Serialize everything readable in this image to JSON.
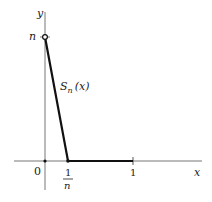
{
  "diagram": {
    "type": "function-graph",
    "axes": {
      "x_label": "x",
      "y_label": "y",
      "origin_label": "0"
    },
    "ticks": {
      "y_tick_label": "n",
      "x_tick_1n_numerator": "1",
      "x_tick_1n_denominator": "n",
      "x_tick_1_label": "1"
    },
    "curve": {
      "label_main": "S",
      "label_sub": "n",
      "label_arg": "(x)",
      "points": [
        [
          0,
          "n"
        ],
        [
          "1/n",
          0
        ],
        [
          1,
          0
        ]
      ]
    },
    "colors": {
      "axis": "#666666",
      "curve": "#111111",
      "text": "#222222"
    }
  }
}
